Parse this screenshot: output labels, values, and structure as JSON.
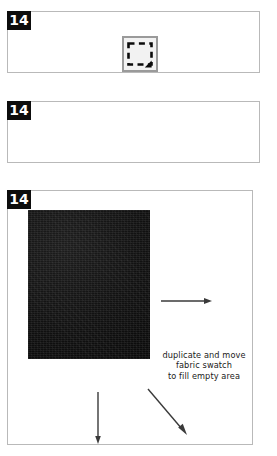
{
  "document": {
    "title": "Step 14 instructional panels",
    "background_color": "#ffffff"
  },
  "panels": [
    {
      "id": "panel-1",
      "badge": "14",
      "icon_name": "rectangular-marquee-tool-icon",
      "icon_label": "Rectangular Marquee Tool"
    },
    {
      "id": "panel-2",
      "badge": "14",
      "icon_name": "move-tool-icon",
      "icon_label": "Move Tool"
    },
    {
      "id": "panel-3",
      "badge": "14",
      "swatch_label": "fabric swatch",
      "swatch_color": "#141414",
      "annotation_lines": [
        "duplicate and move",
        "fabric swatch",
        "to fill empty area"
      ],
      "arrows": [
        {
          "name": "arrow-right",
          "direction": "right"
        },
        {
          "name": "arrow-down",
          "direction": "down"
        },
        {
          "name": "arrow-diagonal",
          "direction": "down-right"
        }
      ]
    }
  ],
  "colors": {
    "badge_background": "#0d0d0d",
    "badge_text": "#ffffff",
    "panel_border": "#b9b9b9",
    "icon_chrome_border": "#9a9a9a",
    "icon_chrome_fill": "#f2f2f2",
    "arrow_stroke": "#3a3a3a",
    "text": "#1a1a1a"
  }
}
